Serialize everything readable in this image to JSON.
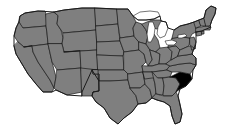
{
  "map": {
    "title": "United States map with South Carolina highlighted",
    "projection": "albers-usa-approx",
    "width": 225,
    "height": 131,
    "background_color": "#ffffff",
    "default_state_fill": "#7f7f7f",
    "highlight_fill": "#000000",
    "border_color": "#1a1a1a",
    "outline_color": "#1a1a1a",
    "lake_fill": "#ffffff",
    "border_width": 0.7,
    "outline_width": 1.0,
    "highlighted_states": [
      "South Carolina"
    ],
    "highlighted_state_code": "SC",
    "legend_visible": false,
    "labels_visible": false,
    "states": [
      {
        "code": "WA",
        "name": "Washington",
        "highlighted": false
      },
      {
        "code": "OR",
        "name": "Oregon",
        "highlighted": false
      },
      {
        "code": "CA",
        "name": "California",
        "highlighted": false
      },
      {
        "code": "NV",
        "name": "Nevada",
        "highlighted": false
      },
      {
        "code": "ID",
        "name": "Idaho",
        "highlighted": false
      },
      {
        "code": "MT",
        "name": "Montana",
        "highlighted": false
      },
      {
        "code": "WY",
        "name": "Wyoming",
        "highlighted": false
      },
      {
        "code": "UT",
        "name": "Utah",
        "highlighted": false
      },
      {
        "code": "AZ",
        "name": "Arizona",
        "highlighted": false
      },
      {
        "code": "NM",
        "name": "New Mexico",
        "highlighted": false
      },
      {
        "code": "CO",
        "name": "Colorado",
        "highlighted": false
      },
      {
        "code": "ND",
        "name": "North Dakota",
        "highlighted": false
      },
      {
        "code": "SD",
        "name": "South Dakota",
        "highlighted": false
      },
      {
        "code": "NE",
        "name": "Nebraska",
        "highlighted": false
      },
      {
        "code": "KS",
        "name": "Kansas",
        "highlighted": false
      },
      {
        "code": "OK",
        "name": "Oklahoma",
        "highlighted": false
      },
      {
        "code": "TX",
        "name": "Texas",
        "highlighted": false
      },
      {
        "code": "MN",
        "name": "Minnesota",
        "highlighted": false
      },
      {
        "code": "IA",
        "name": "Iowa",
        "highlighted": false
      },
      {
        "code": "MO",
        "name": "Missouri",
        "highlighted": false
      },
      {
        "code": "AR",
        "name": "Arkansas",
        "highlighted": false
      },
      {
        "code": "LA",
        "name": "Louisiana",
        "highlighted": false
      },
      {
        "code": "WI",
        "name": "Wisconsin",
        "highlighted": false
      },
      {
        "code": "IL",
        "name": "Illinois",
        "highlighted": false
      },
      {
        "code": "MS",
        "name": "Mississippi",
        "highlighted": false
      },
      {
        "code": "MI",
        "name": "Michigan",
        "highlighted": false
      },
      {
        "code": "IN",
        "name": "Indiana",
        "highlighted": false
      },
      {
        "code": "KY",
        "name": "Kentucky",
        "highlighted": false
      },
      {
        "code": "TN",
        "name": "Tennessee",
        "highlighted": false
      },
      {
        "code": "AL",
        "name": "Alabama",
        "highlighted": false
      },
      {
        "code": "GA",
        "name": "Georgia",
        "highlighted": false
      },
      {
        "code": "FL",
        "name": "Florida",
        "highlighted": false
      },
      {
        "code": "SC",
        "name": "South Carolina",
        "highlighted": true
      },
      {
        "code": "NC",
        "name": "North Carolina",
        "highlighted": false
      },
      {
        "code": "VA",
        "name": "Virginia",
        "highlighted": false
      },
      {
        "code": "WV",
        "name": "West Virginia",
        "highlighted": false
      },
      {
        "code": "OH",
        "name": "Ohio",
        "highlighted": false
      },
      {
        "code": "PA",
        "name": "Pennsylvania",
        "highlighted": false
      },
      {
        "code": "NY",
        "name": "New York",
        "highlighted": false
      },
      {
        "code": "MD",
        "name": "Maryland",
        "highlighted": false
      },
      {
        "code": "DE",
        "name": "Delaware",
        "highlighted": false
      },
      {
        "code": "NJ",
        "name": "New Jersey",
        "highlighted": false
      },
      {
        "code": "CT",
        "name": "Connecticut",
        "highlighted": false
      },
      {
        "code": "RI",
        "name": "Rhode Island",
        "highlighted": false
      },
      {
        "code": "MA",
        "name": "Massachusetts",
        "highlighted": false
      },
      {
        "code": "VT",
        "name": "Vermont",
        "highlighted": false
      },
      {
        "code": "NH",
        "name": "New Hampshire",
        "highlighted": false
      },
      {
        "code": "ME",
        "name": "Maine",
        "highlighted": false
      }
    ],
    "lakes": [
      {
        "name": "Lake Superior"
      },
      {
        "name": "Lake Michigan"
      },
      {
        "name": "Lake Huron"
      },
      {
        "name": "Lake Erie"
      },
      {
        "name": "Lake Ontario"
      }
    ]
  }
}
